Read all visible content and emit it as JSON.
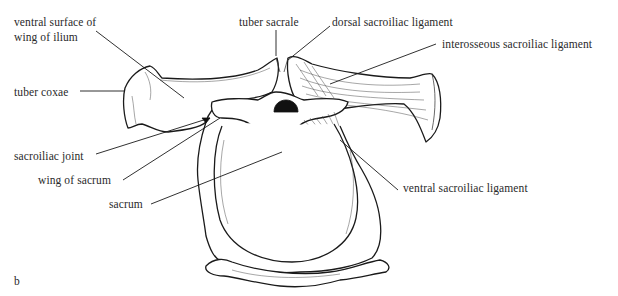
{
  "figure": {
    "panel_letter": "b",
    "labels": {
      "ventral_surface_line1": "ventral surface of",
      "ventral_surface_line2": "wing of ilium",
      "tuber_coxae": "tuber coxae",
      "tuber_sacrale": "tuber sacrale",
      "dorsal_sacroiliac_ligament": "dorsal sacroiliac ligament",
      "interosseous_sacroiliac_ligament": "interosseous sacroiliac ligament",
      "sacroiliac_joint": "sacroiliac joint",
      "wing_of_sacrum": "wing of sacrum",
      "sacrum": "sacrum",
      "ventral_sacroiliac_ligament": "ventral sacroiliac ligament"
    }
  }
}
